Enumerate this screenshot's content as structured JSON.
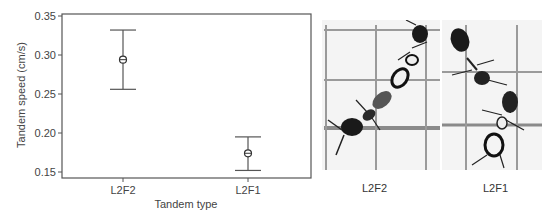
{
  "chart_data": {
    "type": "errorbar",
    "title": "",
    "xlabel": "Tandem type",
    "ylabel": "Tandem speed (cm/s)",
    "ylim": [
      0.15,
      0.35
    ],
    "yticks": [
      0.15,
      0.2,
      0.25,
      0.3,
      0.35
    ],
    "ytick_labels": [
      "0.15",
      "0.20",
      "0.25",
      "0.30",
      "0.35"
    ],
    "categories": [
      "L2F2",
      "L2F1"
    ],
    "series": [
      {
        "name": "Tandem speed",
        "values": [
          0.294,
          0.174
        ],
        "lower": [
          0.256,
          0.152
        ],
        "upper": [
          0.332,
          0.195
        ]
      }
    ],
    "grid": false,
    "legend": "none"
  },
  "photos": [
    {
      "label": "L2F2",
      "description": "Two ants in tandem running on grid paper (L2F2)"
    },
    {
      "label": "L2F1",
      "description": "Two ants in tandem running on grid paper (L2F1)"
    }
  ]
}
